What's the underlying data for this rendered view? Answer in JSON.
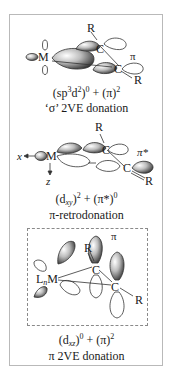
{
  "figure": {
    "panels": [
      {
        "id": "sigma-donation",
        "atoms": {
          "metal": "M",
          "carbon1": "C",
          "carbon2": "C",
          "substituent1": "R",
          "substituent2": "R"
        },
        "orbital_label": "π",
        "caption_formula": {
          "part1_base": "(sp",
          "part1_sup1": "3",
          "part1_mid": "d",
          "part1_sup2": "2",
          "part1_close": ")",
          "part1_exp": "0",
          "plus": " + ",
          "part2_base": "(π)",
          "part2_exp": "2"
        },
        "caption_text": "‘σ’ 2VE donation"
      },
      {
        "id": "pi-retrodonation",
        "atoms": {
          "metal": "M",
          "carbon1": "C",
          "carbon2": "C",
          "substituent1": "R",
          "substituent2": "R"
        },
        "axes": {
          "x": "x",
          "z": "z"
        },
        "orbital_label": "π*",
        "caption_formula": {
          "part1_base": "(d",
          "part1_sub": "xy",
          "part1_close": ")",
          "part1_exp": "2",
          "plus": " + ",
          "part2_base": "(π*)",
          "part2_exp": "0"
        },
        "caption_text": "π-retrodonation"
      },
      {
        "id": "pi-donation",
        "atoms": {
          "metal": "M",
          "ligand_prefix": "L",
          "ligand_sub": "n",
          "carbon1": "C",
          "carbon2": "C",
          "substituent1": "R",
          "substituent2": "R"
        },
        "orbital_label": "π",
        "caption_formula": {
          "part1_base": "(d",
          "part1_sub": "xz",
          "part1_close": ")",
          "part1_exp": "0",
          "plus": " + ",
          "part2_base": "(π)",
          "part2_exp": "2"
        },
        "caption_text": "π 2VE donation"
      }
    ],
    "colors": {
      "frame": "#b9b9b9",
      "ink": "#1a1a1a",
      "lobe_dark": "#3a3a3a",
      "lobe_light": "#f2f2f2",
      "dash": "#8a8a8a"
    }
  }
}
